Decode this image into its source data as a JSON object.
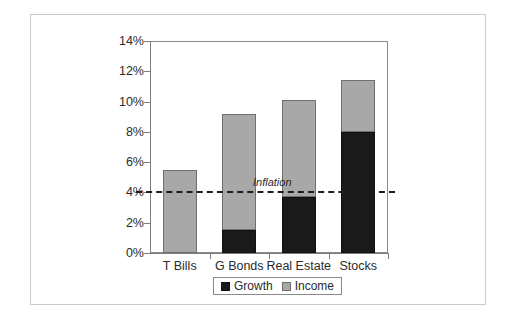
{
  "chart_data": {
    "type": "bar",
    "subtype": "stacked-bar",
    "title": "",
    "xlabel": "",
    "ylabel": "",
    "categories": [
      "T Bills",
      "G Bonds",
      "Real Estate",
      "Stocks"
    ],
    "series": [
      {
        "name": "Growth",
        "color": "#1a1a1a",
        "values": [
          0,
          1.5,
          3.7,
          8.0
        ]
      },
      {
        "name": "Income",
        "color": "#a8a8a8",
        "values": [
          5.5,
          7.7,
          6.4,
          3.4
        ]
      }
    ],
    "totals": [
      5.5,
      9.2,
      10.1,
      11.4
    ],
    "ylim": [
      0,
      14
    ],
    "ytick_values": [
      0,
      2,
      4,
      6,
      8,
      10,
      12,
      14
    ],
    "ytick_labels": [
      "0%",
      "2%",
      "4%",
      "6%",
      "8%",
      "10%",
      "12%",
      "14%"
    ],
    "grid": false,
    "legend_position": "bottom",
    "legend_entries": [
      "Growth",
      "Income"
    ],
    "annotations": [
      {
        "name": "inflation-line",
        "label": "Inflation",
        "value": 4.1,
        "style": "dashed",
        "color": "#1d1d1d"
      }
    ]
  },
  "legend": {
    "growth_label": "Growth",
    "income_label": "Income"
  },
  "annotation": {
    "inflation_label": "Inflation"
  }
}
